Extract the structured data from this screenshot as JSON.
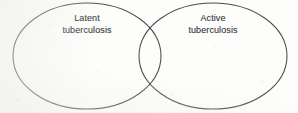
{
  "figure": {
    "type": "venn-diagram-two-set",
    "background_color": "#fdfdfc",
    "stroke_color": "#3d3d3d",
    "text_color": "#3a3a3a",
    "width": 298,
    "height": 113
  },
  "sets": {
    "left": {
      "name": "latent-tuberculosis",
      "line1": "Latent",
      "line2": "tuberculosis",
      "center_x": 87,
      "center_y": 56,
      "radius_x": 74,
      "radius_y": 53
    },
    "right": {
      "name": "active-tuberculosis",
      "line1": "Active",
      "line2": "tuberculosis",
      "center_x": 213,
      "center_y": 56,
      "radius_x": 74,
      "radius_y": 53
    }
  },
  "intersection": {
    "name": "overlap-region",
    "label": "",
    "top_crossing_x": 150,
    "top_crossing_y": 14,
    "bottom_crossing_x": 150,
    "bottom_crossing_y": 101
  }
}
